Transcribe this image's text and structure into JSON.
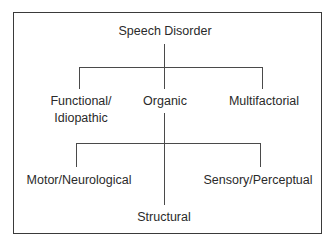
{
  "diagram": {
    "type": "tree",
    "root": {
      "label": "Speech Disorder"
    },
    "level1": [
      {
        "label_line1": "Functional/",
        "label_line2": "Idiopathic"
      },
      {
        "label": "Organic"
      },
      {
        "label": "Multifactorial"
      }
    ],
    "level2": [
      {
        "label": "Motor/Neurological"
      },
      {
        "label": "Structural"
      },
      {
        "label": "Sensory/Perceptual"
      }
    ],
    "edges": [
      [
        "Speech Disorder",
        "Functional/Idiopathic"
      ],
      [
        "Speech Disorder",
        "Organic"
      ],
      [
        "Speech Disorder",
        "Multifactorial"
      ],
      [
        "Organic",
        "Motor/Neurological"
      ],
      [
        "Organic",
        "Structural"
      ],
      [
        "Organic",
        "Sensory/Perceptual"
      ]
    ],
    "colors": {
      "line": "#4a4a4a",
      "border": "#3a3a3a",
      "text": "#2a2a2a",
      "background": "#ffffff"
    }
  }
}
